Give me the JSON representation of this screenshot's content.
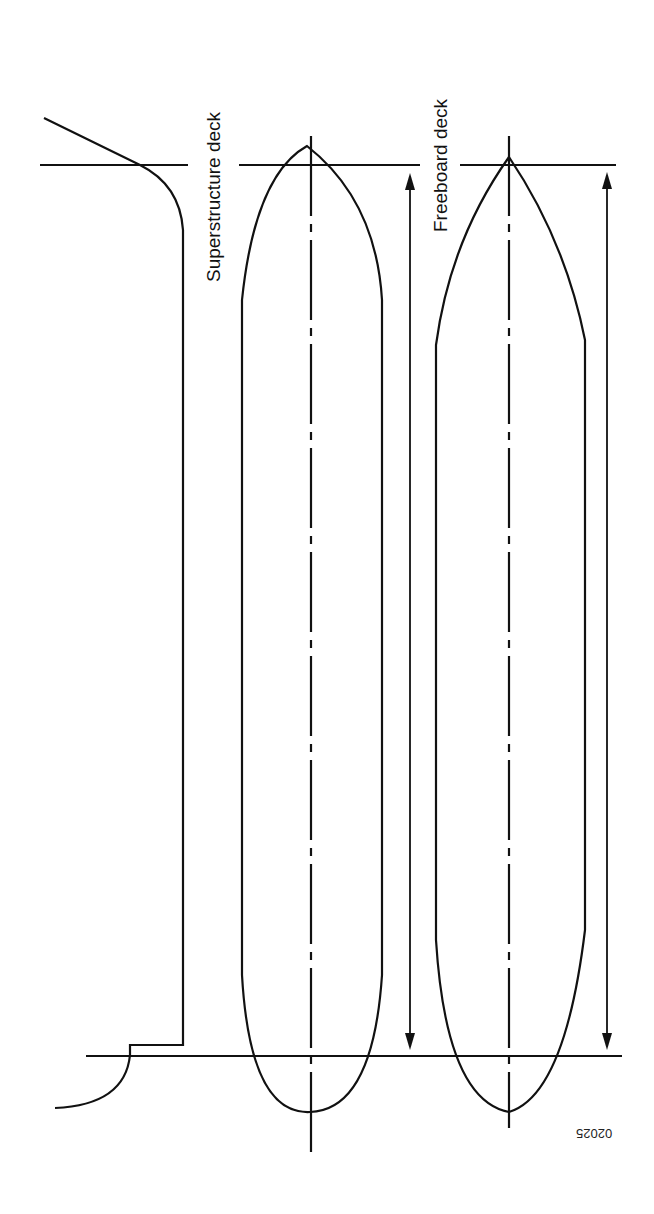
{
  "figure": {
    "type": "deck-line-diagram",
    "labels": {
      "superstructure_deck": "Superstructure deck",
      "freeboard_deck": "Freeboard deck"
    },
    "figure_code": "02025",
    "clipped_caption": "",
    "colors": {
      "line": "#111111",
      "background": "#ffffff"
    }
  }
}
